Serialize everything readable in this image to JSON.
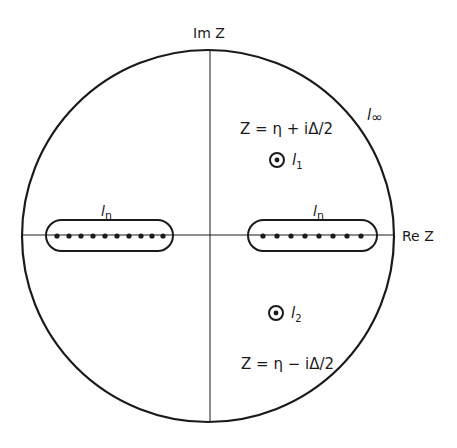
{
  "diagram": {
    "axes": {
      "imaginary_label": "Im Z",
      "real_label": "Re Z"
    },
    "contours": {
      "infinity": {
        "label": "l",
        "sub": "∞"
      },
      "left_cut": {
        "label": "l",
        "sub": "η",
        "dots": 10
      },
      "right_cut": {
        "label": "l",
        "sub": "η",
        "dots": 8
      },
      "upper_pole": {
        "label": "l",
        "sub": "1",
        "equation": "Z = η + iΔ/2"
      },
      "lower_pole": {
        "label": "l",
        "sub": "2",
        "equation": "Z = η − iΔ/2"
      }
    },
    "colors": {
      "ink": "#1a1a1a",
      "background": "#ffffff"
    }
  }
}
